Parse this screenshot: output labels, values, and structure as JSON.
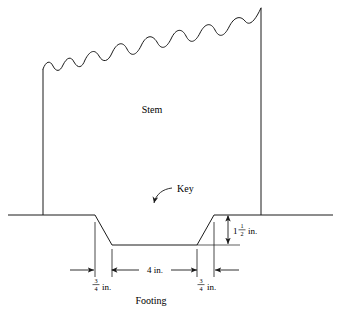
{
  "figure": {
    "title_caption": "Footing",
    "labels": {
      "stem": "Stem",
      "key": "Key",
      "footing": "Footing"
    },
    "dimensions": [
      {
        "id": "key-width",
        "text": "4 in.",
        "value": 4,
        "unit": "in.",
        "orientation": "horizontal",
        "describes": "width of key notch bottom"
      },
      {
        "id": "left-slope-run",
        "whole": "",
        "numerator": "3",
        "denominator": "4",
        "unit": "in.",
        "value": 0.75,
        "orientation": "horizontal",
        "describes": "horizontal run of left key slope"
      },
      {
        "id": "right-slope-run",
        "whole": "",
        "numerator": "3",
        "denominator": "4",
        "unit": "in.",
        "value": 0.75,
        "orientation": "horizontal",
        "describes": "horizontal run of right key slope"
      },
      {
        "id": "key-depth",
        "whole": "1",
        "numerator": "1",
        "denominator": "2",
        "unit": "in.",
        "value": 1.5,
        "orientation": "vertical",
        "describes": "depth of key below footing line"
      }
    ],
    "colors": {
      "line": "#1a1a1a",
      "background": "#ffffff",
      "text": "#000000"
    }
  }
}
